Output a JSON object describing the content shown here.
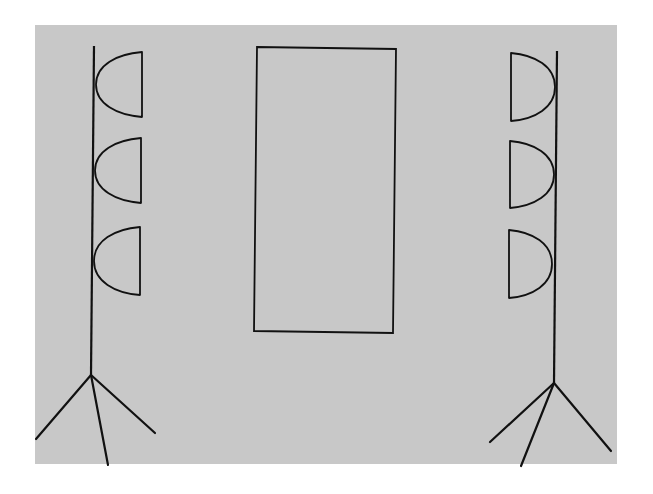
{
  "diagram": {
    "type": "stage-lighting-layout",
    "colors": {
      "background": "#ffffff",
      "panel": "#c8c8c8",
      "stroke": "#111111"
    },
    "panel": {
      "x": 35,
      "y": 25,
      "width": 582,
      "height": 439
    },
    "left_stand": {
      "pole": {
        "x1": 94,
        "y1": 46,
        "x2": 91,
        "y2": 375
      },
      "legs": [
        {
          "x1": 91,
          "y1": 375,
          "x2": 36,
          "y2": 439
        },
        {
          "x1": 91,
          "y1": 375,
          "x2": 108,
          "y2": 465
        },
        {
          "x1": 91,
          "y1": 375,
          "x2": 155,
          "y2": 433
        }
      ],
      "lamps": [
        {
          "flat_x": 142,
          "top": 52,
          "bottom": 117,
          "tip_x": 96
        },
        {
          "flat_x": 141,
          "top": 138,
          "bottom": 203,
          "tip_x": 95
        },
        {
          "flat_x": 140,
          "top": 227,
          "bottom": 295,
          "tip_x": 94
        }
      ]
    },
    "right_stand": {
      "pole": {
        "x1": 557,
        "y1": 51,
        "x2": 554,
        "y2": 383
      },
      "legs": [
        {
          "x1": 554,
          "y1": 383,
          "x2": 490,
          "y2": 442
        },
        {
          "x1": 554,
          "y1": 383,
          "x2": 521,
          "y2": 466
        },
        {
          "x1": 554,
          "y1": 383,
          "x2": 611,
          "y2": 451
        }
      ],
      "lamps": [
        {
          "flat_x": 511,
          "top": 53,
          "bottom": 121,
          "tip_x": 555
        },
        {
          "flat_x": 510,
          "top": 141,
          "bottom": 208,
          "tip_x": 554
        },
        {
          "flat_x": 509,
          "top": 230,
          "bottom": 298,
          "tip_x": 552
        }
      ]
    },
    "subject_rect": {
      "points": [
        [
          257,
          47
        ],
        [
          396,
          49
        ],
        [
          393,
          333
        ],
        [
          254,
          331
        ]
      ]
    }
  }
}
